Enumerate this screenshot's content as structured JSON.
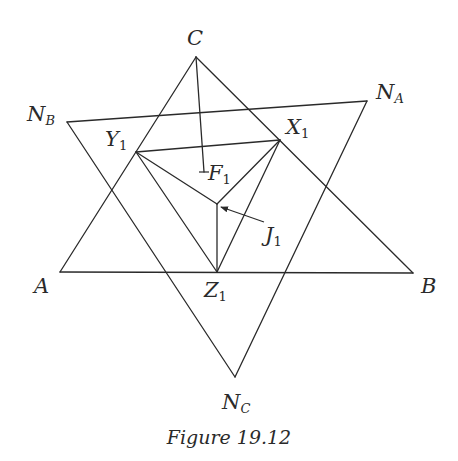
{
  "figure": {
    "caption": "Figure 19.12",
    "stroke_color": "#2a2a2a",
    "points": {
      "C": {
        "x": 196,
        "y": 57
      },
      "A": {
        "x": 60,
        "y": 272
      },
      "B": {
        "x": 413,
        "y": 273
      },
      "NA": {
        "x": 367,
        "y": 101
      },
      "NB": {
        "x": 67,
        "y": 122
      },
      "NC": {
        "x": 235,
        "y": 377
      },
      "X1": {
        "x": 280,
        "y": 140
      },
      "Y1": {
        "x": 136,
        "y": 152
      },
      "Z1": {
        "x": 217,
        "y": 272
      },
      "J1": {
        "x": 217,
        "y": 204
      },
      "F1": {
        "x": 204,
        "y": 172
      }
    },
    "labels": {
      "C": {
        "main": "C",
        "sub": ""
      },
      "A": {
        "main": "A",
        "sub": ""
      },
      "B": {
        "main": "B",
        "sub": ""
      },
      "NA": {
        "main": "N",
        "sub": "A"
      },
      "NB": {
        "main": "N",
        "sub": "B"
      },
      "NC": {
        "main": "N",
        "sub": "C"
      },
      "X1": {
        "main": "X",
        "sub": "1"
      },
      "Y1": {
        "main": "Y",
        "sub": "1"
      },
      "Z1": {
        "main": "Z",
        "sub": "1"
      },
      "J1": {
        "main": "J",
        "sub": "1"
      },
      "F1": {
        "main": "F",
        "sub": "1"
      }
    },
    "segments": [
      {
        "name": "side-CA",
        "from": "C",
        "to": "A"
      },
      {
        "name": "side-CB",
        "from": "C",
        "to": "B"
      },
      {
        "name": "side-AB",
        "from": "A",
        "to": "B"
      },
      {
        "name": "side-NA-NB",
        "from": "NA",
        "to": "NB"
      },
      {
        "name": "side-NB-NC",
        "from": "NB",
        "to": "NC"
      },
      {
        "name": "side-NC-NA",
        "from": "NC",
        "to": "NA"
      },
      {
        "name": "pedal-X1Y1",
        "from": "X1",
        "to": "Y1"
      },
      {
        "name": "pedal-Y1Z1",
        "from": "Y1",
        "to": "Z1"
      },
      {
        "name": "pedal-Z1X1",
        "from": "Z1",
        "to": "X1"
      },
      {
        "name": "ray-J1-X1",
        "from": "J1",
        "to": "X1"
      },
      {
        "name": "ray-J1-Y1",
        "from": "J1",
        "to": "Y1"
      },
      {
        "name": "ray-J1-Z1",
        "from": "J1",
        "to": "Z1"
      },
      {
        "name": "cevian-C-F1",
        "from": "C",
        "to": "F1"
      }
    ]
  }
}
